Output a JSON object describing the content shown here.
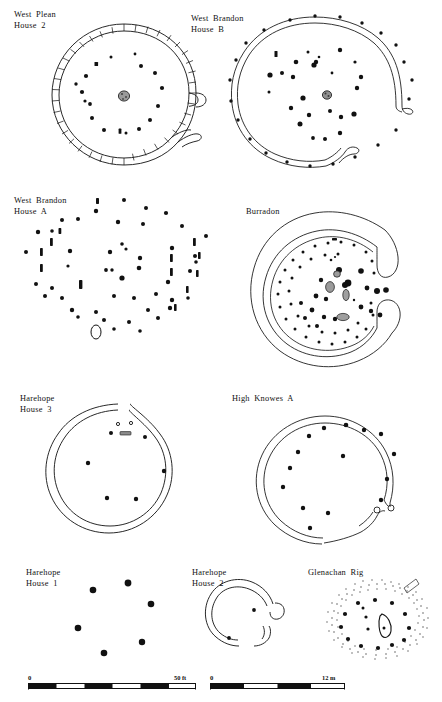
{
  "figure": {
    "caption_present": false,
    "ink_color": "#111111",
    "stone_fill": "#8c8c8c",
    "background": "#ffffff"
  },
  "panels": [
    {
      "id": "west-plean-house-2",
      "label": "West Plean\nHouse 2",
      "label_x": 14,
      "label_y": 10,
      "wall_type": "segmented-palisade-double-ring",
      "entrance": "east",
      "center": {
        "cx": 124,
        "cy": 96
      },
      "radius": 72,
      "hearth": {
        "x": 124,
        "y": 96,
        "rx": 5.5,
        "ry": 5
      },
      "posts": [
        {
          "x": 111,
          "y": 57,
          "r": 1.5
        },
        {
          "x": 135,
          "y": 54,
          "r": 1.4
        },
        {
          "x": 96,
          "y": 64,
          "r": 2.0
        },
        {
          "x": 141,
          "y": 66,
          "r": 2.0
        },
        {
          "x": 86,
          "y": 76,
          "r": 2.1
        },
        {
          "x": 155,
          "y": 73,
          "r": 2.0
        },
        {
          "x": 82,
          "y": 92,
          "r": 2.1
        },
        {
          "x": 162,
          "y": 88,
          "r": 2.1
        },
        {
          "x": 76,
          "y": 84,
          "r": 1.7
        },
        {
          "x": 90,
          "y": 104,
          "r": 1.9
        },
        {
          "x": 85,
          "y": 101,
          "r": 1.6
        },
        {
          "x": 158,
          "y": 106,
          "r": 2.0
        },
        {
          "x": 92,
          "y": 118,
          "r": 2.0
        },
        {
          "x": 150,
          "y": 120,
          "r": 2.0
        },
        {
          "x": 104,
          "y": 130,
          "r": 2.0
        },
        {
          "x": 139,
          "y": 129,
          "r": 2.0
        },
        {
          "x": 120,
          "y": 134,
          "r": 1.8
        },
        {
          "x": 126,
          "y": 133,
          "r": 1.5
        },
        {
          "x": 116,
          "y": 131,
          "r": 1.4
        }
      ]
    },
    {
      "id": "west-brandon-house-b",
      "label": "West Brandon\nHouse B",
      "label_x": 191,
      "label_y": 14,
      "wall_type": "double-line-ring",
      "entrance": "east",
      "center": {
        "cx": 317,
        "cy": 93
      },
      "radius": 66,
      "hearth": {
        "x": 327,
        "y": 95,
        "rx": 4.5,
        "ry": 4
      },
      "posts": [
        {
          "x": 308,
          "y": 52,
          "r": 1.5
        },
        {
          "x": 319,
          "y": 57,
          "r": 1.3
        },
        {
          "x": 314,
          "y": 65,
          "r": 2.6
        },
        {
          "x": 316,
          "y": 63,
          "r": 2.2
        },
        {
          "x": 340,
          "y": 50,
          "r": 2.2
        },
        {
          "x": 355,
          "y": 62,
          "r": 1.6
        },
        {
          "x": 361,
          "y": 77,
          "r": 2.2
        },
        {
          "x": 357,
          "y": 88,
          "r": 2.2
        },
        {
          "x": 296,
          "y": 62,
          "r": 2.3
        },
        {
          "x": 282,
          "y": 73,
          "r": 2.0
        },
        {
          "x": 270,
          "y": 75,
          "r": 2.6
        },
        {
          "x": 293,
          "y": 77,
          "r": 2.2
        },
        {
          "x": 291,
          "y": 108,
          "r": 2.2
        },
        {
          "x": 303,
          "y": 98,
          "r": 2.6
        },
        {
          "x": 309,
          "y": 115,
          "r": 2.2
        },
        {
          "x": 300,
          "y": 124,
          "r": 2.5
        },
        {
          "x": 330,
          "y": 111,
          "r": 2.0
        },
        {
          "x": 341,
          "y": 117,
          "r": 2.2
        },
        {
          "x": 354,
          "y": 114,
          "r": 2.6
        },
        {
          "x": 340,
          "y": 133,
          "r": 2.2
        },
        {
          "x": 325,
          "y": 139,
          "r": 2.0
        },
        {
          "x": 313,
          "y": 138,
          "r": 1.9
        },
        {
          "x": 276,
          "y": 55,
          "r": 1.7
        },
        {
          "x": 269,
          "y": 92,
          "r": 1.5
        }
      ],
      "outer_posts": [
        {
          "x": 290,
          "y": 20,
          "r": 1.6
        },
        {
          "x": 315,
          "y": 16,
          "r": 1.6
        },
        {
          "x": 340,
          "y": 17,
          "r": 1.6
        },
        {
          "x": 362,
          "y": 23,
          "r": 1.6
        },
        {
          "x": 381,
          "y": 33,
          "r": 1.6
        },
        {
          "x": 396,
          "y": 45,
          "r": 1.6
        },
        {
          "x": 404,
          "y": 62,
          "r": 1.6
        },
        {
          "x": 412,
          "y": 80,
          "r": 1.6
        },
        {
          "x": 409,
          "y": 99,
          "r": 1.6
        },
        {
          "x": 264,
          "y": 30,
          "r": 1.6
        },
        {
          "x": 246,
          "y": 43,
          "r": 1.6
        },
        {
          "x": 236,
          "y": 60,
          "r": 1.6
        },
        {
          "x": 230,
          "y": 80,
          "r": 1.6
        },
        {
          "x": 231,
          "y": 101,
          "r": 1.6
        },
        {
          "x": 238,
          "y": 120,
          "r": 1.6
        },
        {
          "x": 250,
          "y": 139,
          "r": 1.6
        },
        {
          "x": 266,
          "y": 153,
          "r": 1.6
        },
        {
          "x": 287,
          "y": 162,
          "r": 1.6
        },
        {
          "x": 310,
          "y": 166,
          "r": 1.6
        },
        {
          "x": 333,
          "y": 164,
          "r": 1.6
        },
        {
          "x": 355,
          "y": 157,
          "r": 1.6
        },
        {
          "x": 378,
          "y": 145,
          "r": 1.6
        },
        {
          "x": 396,
          "y": 130,
          "r": 1.6
        }
      ]
    },
    {
      "id": "west-brandon-house-a",
      "label": "West Brandon\nHouse A",
      "label_x": 14,
      "label_y": 196,
      "wall_type": "post-ring-only",
      "entrance": "none",
      "center": {
        "cx": 110,
        "cy": 288
      },
      "radius": 84,
      "hearth": {
        "x": 97,
        "y": 323,
        "rx": 5,
        "ry": 7
      }
    },
    {
      "id": "burradon",
      "label": "Burradon",
      "label_x": 246,
      "label_y": 207,
      "wall_type": "broad-enclosure-bank",
      "entrance": "east",
      "center": {
        "cx": 330,
        "cy": 288
      },
      "radius": 78
    },
    {
      "id": "harehope-house-3",
      "label": "Harehope\nHouse 3",
      "label_x": 20,
      "label_y": 394,
      "wall_type": "double-line-ring",
      "entrance": "north",
      "center": {
        "cx": 124,
        "cy": 465
      },
      "radius": 61,
      "posts": [
        {
          "x": 118,
          "y": 424,
          "r": 1.4,
          "hollow": true
        },
        {
          "x": 131,
          "y": 423,
          "r": 1.4,
          "hollow": true
        },
        {
          "x": 111,
          "y": 433,
          "r": 2.0
        },
        {
          "x": 145,
          "y": 437,
          "r": 2.0
        },
        {
          "x": 88,
          "y": 463,
          "r": 2.2
        },
        {
          "x": 164,
          "y": 471,
          "r": 2.2
        },
        {
          "x": 107,
          "y": 498,
          "r": 2.2
        },
        {
          "x": 136,
          "y": 499,
          "r": 2.2
        }
      ],
      "slot": {
        "x": 122,
        "y": 433,
        "w": 11,
        "h": 3.2
      }
    },
    {
      "id": "high-knowes-a",
      "label": "High Knowes A",
      "label_x": 232,
      "label_y": 397,
      "wall_type": "double-line-ring",
      "entrance": "east",
      "center": {
        "cx": 340,
        "cy": 470
      },
      "radius": 66,
      "posts": [
        {
          "x": 346,
          "y": 425,
          "r": 2.3
        },
        {
          "x": 324,
          "y": 428,
          "r": 2.2
        },
        {
          "x": 364,
          "y": 430,
          "r": 2.2
        },
        {
          "x": 309,
          "y": 436,
          "r": 2.2
        },
        {
          "x": 381,
          "y": 434,
          "r": 2.2
        },
        {
          "x": 298,
          "y": 452,
          "r": 2.2
        },
        {
          "x": 394,
          "y": 454,
          "r": 2.2
        },
        {
          "x": 290,
          "y": 468,
          "r": 2.2
        },
        {
          "x": 343,
          "y": 456,
          "r": 2.2
        },
        {
          "x": 387,
          "y": 479,
          "r": 2.2
        },
        {
          "x": 283,
          "y": 487,
          "r": 2.2
        },
        {
          "x": 381,
          "y": 500,
          "r": 2.2
        },
        {
          "x": 303,
          "y": 508,
          "r": 2.2
        },
        {
          "x": 328,
          "y": 513,
          "r": 2.2
        },
        {
          "x": 310,
          "y": 528,
          "r": 2.2
        }
      ]
    },
    {
      "id": "harehope-house-1",
      "label": "Harehope\nHouse 1",
      "label_x": 26,
      "label_y": 570,
      "wall_type": "post-ring-only",
      "entrance": "none",
      "posts": [
        {
          "x": 93,
          "y": 590,
          "r": 3.2
        },
        {
          "x": 128,
          "y": 583,
          "r": 3.3
        },
        {
          "x": 151,
          "y": 604,
          "r": 3.2
        },
        {
          "x": 78,
          "y": 628,
          "r": 3.2
        },
        {
          "x": 104,
          "y": 653,
          "r": 3.2
        },
        {
          "x": 142,
          "y": 642,
          "r": 3.1
        }
      ]
    },
    {
      "id": "harehope-house-2",
      "label": "Harehope\nHouse 2",
      "label_x": 192,
      "label_y": 570,
      "wall_type": "thick-arc-wall",
      "entrance": "east",
      "center": {
        "cx": 255,
        "cy": 625
      },
      "radius": 28,
      "posts": [
        {
          "x": 265,
          "y": 610,
          "r": 1.9
        },
        {
          "x": 240,
          "y": 638,
          "r": 1.9
        }
      ]
    },
    {
      "id": "glenachan-rig",
      "label": "Glenachan Rig",
      "label_x": 308,
      "label_y": 570,
      "wall_type": "stippled-bank-ring",
      "entrance": "north-east",
      "center": {
        "cx": 377,
        "cy": 627
      },
      "radius": 44,
      "stone_feature": {
        "x": 384,
        "y": 630
      },
      "posts": [
        {
          "x": 355,
          "y": 604,
          "r": 2.1
        },
        {
          "x": 372,
          "y": 601,
          "r": 2.1
        },
        {
          "x": 389,
          "y": 604,
          "r": 2.1
        },
        {
          "x": 339,
          "y": 616,
          "r": 2.1
        },
        {
          "x": 407,
          "y": 615,
          "r": 2.1
        },
        {
          "x": 334,
          "y": 633,
          "r": 2.1
        },
        {
          "x": 414,
          "y": 633,
          "r": 2.1
        },
        {
          "x": 338,
          "y": 650,
          "r": 2.1
        },
        {
          "x": 410,
          "y": 650,
          "r": 2.1
        },
        {
          "x": 352,
          "y": 661,
          "r": 2.1
        },
        {
          "x": 372,
          "y": 663,
          "r": 2.1
        },
        {
          "x": 392,
          "y": 660,
          "r": 2.1
        },
        {
          "x": 362,
          "y": 626,
          "r": 1.6
        },
        {
          "x": 365,
          "y": 639,
          "r": 1.6
        },
        {
          "x": 360,
          "y": 613,
          "r": 1.6
        }
      ]
    }
  ],
  "scalebars": [
    {
      "id": "scalebar-feet",
      "start_label": "0",
      "end_label": "50 ft",
      "x": 28,
      "y": 678,
      "width": 168,
      "segments": 6,
      "unit": "ft",
      "max_value": 50
    },
    {
      "id": "scalebar-metres",
      "start_label": "0",
      "end_label": "12 m",
      "x": 210,
      "y": 678,
      "width": 135,
      "segments": 4,
      "unit": "m",
      "max_value": 12
    }
  ]
}
